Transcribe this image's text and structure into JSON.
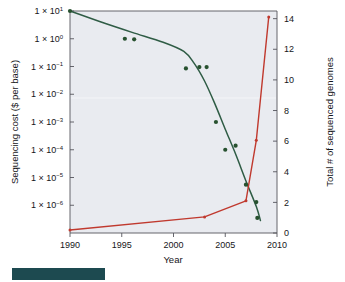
{
  "chart_data": {
    "type": "line",
    "title": "",
    "xlabel": "Year",
    "ylabel": "Sequencing cost ($ per base)",
    "ylabel_right": "Total # of sequenced genomes",
    "xlim": [
      1990,
      2010
    ],
    "xticks": [
      1990,
      1995,
      2000,
      2005,
      2010
    ],
    "xticklabels": [
      "1990",
      "1995",
      "2000",
      "2005",
      "2010"
    ],
    "y_left_scale": "log",
    "ylim_left": [
      1e-07,
      10.0
    ],
    "yticks_left": [
      10,
      1,
      0.1,
      0.01,
      0.001,
      0.0001,
      1e-05,
      1e-06
    ],
    "yticklabels_left": [
      {
        "mantissa": "1 × 10",
        "exp": "1"
      },
      {
        "mantissa": "1 × 10",
        "exp": "0"
      },
      {
        "mantissa": "1 × 10",
        "exp": "−1"
      },
      {
        "mantissa": "1 × 10",
        "exp": "−2"
      },
      {
        "mantissa": "1 × 10",
        "exp": "−3"
      },
      {
        "mantissa": "1 × 10",
        "exp": "−4"
      },
      {
        "mantissa": "1 × 10",
        "exp": "−5"
      },
      {
        "mantissa": "1 × 10",
        "exp": "−6"
      }
    ],
    "ylim_right": [
      0,
      14.5
    ],
    "yticks_right": [
      0,
      2,
      4,
      6,
      8,
      10,
      12,
      14
    ],
    "yticklabels_right": [
      "0",
      "2",
      "4",
      "6",
      "8",
      "10",
      "12",
      "14"
    ],
    "grid": false,
    "legend_position": "none",
    "colors": {
      "sequencing_cost": "#2f5c45",
      "genome_count": "#c0392e",
      "plot_background": "#e9ebf0",
      "axis": "#55555c",
      "accent_bar": "#1d4a50"
    },
    "series": [
      {
        "name": "Sequencing cost ($ per base)",
        "axis": "left",
        "color": "#2f5c45",
        "type": "scatter+trend",
        "points": [
          {
            "x": 1990.0,
            "y": 10
          },
          {
            "x": 1995.3,
            "y": 1.0
          },
          {
            "x": 1996.2,
            "y": 0.95
          },
          {
            "x": 2001.2,
            "y": 0.085
          },
          {
            "x": 2002.5,
            "y": 0.095
          },
          {
            "x": 2003.2,
            "y": 0.095
          },
          {
            "x": 2004.1,
            "y": 0.001
          },
          {
            "x": 2005.0,
            "y": 0.0001
          },
          {
            "x": 2006.0,
            "y": 0.00014
          },
          {
            "x": 2007.0,
            "y": 5.5e-06
          },
          {
            "x": 2008.0,
            "y": 1.3e-06
          },
          {
            "x": 2008.1,
            "y": 3.5e-07
          }
        ],
        "trend": [
          {
            "x": 1990.0,
            "y": 10
          },
          {
            "x": 1993.0,
            "y": 4.0
          },
          {
            "x": 1996.0,
            "y": 1.7
          },
          {
            "x": 1999.0,
            "y": 0.75
          },
          {
            "x": 2001.0,
            "y": 0.35
          },
          {
            "x": 2002.0,
            "y": 0.13
          },
          {
            "x": 2003.0,
            "y": 0.03
          },
          {
            "x": 2004.0,
            "y": 0.0045
          },
          {
            "x": 2005.0,
            "y": 0.00055
          },
          {
            "x": 2006.0,
            "y": 7e-05
          },
          {
            "x": 2007.0,
            "y": 7.5e-06
          },
          {
            "x": 2008.0,
            "y": 9e-07
          },
          {
            "x": 2008.4,
            "y": 2.8e-07
          }
        ]
      },
      {
        "name": "Total # of sequenced genomes",
        "axis": "right",
        "color": "#c0392e",
        "type": "line+markers",
        "points": [
          {
            "x": 1990.0,
            "y": 0.2
          },
          {
            "x": 2003.0,
            "y": 1.05
          },
          {
            "x": 2007.0,
            "y": 2.1
          },
          {
            "x": 2008.0,
            "y": 6.05
          },
          {
            "x": 2009.2,
            "y": 14.1
          }
        ]
      }
    ]
  },
  "axes": {
    "x_title": "Year",
    "y_left_title": "Sequencing cost ($ per base)",
    "y_right_title": "Total # of sequenced genomes"
  },
  "decoration": {
    "bottom_bar_color": "#1d4a50"
  }
}
